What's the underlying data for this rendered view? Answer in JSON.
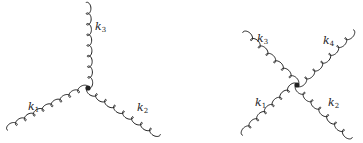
{
  "diagrams": [
    {
      "name": "three-gluon-vertex",
      "vertex": {
        "x": 88,
        "y": 88
      },
      "legs": [
        {
          "name": "k3",
          "end": {
            "x": 86,
            "y": 3
          },
          "label": {
            "base": "k",
            "sub": "3",
            "x": 95,
            "y": 30
          }
        },
        {
          "name": "k1",
          "end": {
            "x": 8,
            "y": 130
          },
          "label": {
            "base": "k",
            "sub": "1",
            "x": 28,
            "y": 110
          }
        },
        {
          "name": "k2",
          "end": {
            "x": 160,
            "y": 134
          },
          "label": {
            "base": "k",
            "sub": "2",
            "x": 137,
            "y": 111
          }
        }
      ]
    },
    {
      "name": "four-gluon-vertex",
      "vertex": {
        "x": 297,
        "y": 85
      },
      "legs": [
        {
          "name": "k3",
          "end": {
            "x": 243,
            "y": 33
          },
          "label": {
            "base": "k",
            "sub": "3",
            "x": 257,
            "y": 42
          }
        },
        {
          "name": "k4",
          "end": {
            "x": 353,
            "y": 30
          },
          "label": {
            "base": "k",
            "sub": "4",
            "x": 323,
            "y": 44
          }
        },
        {
          "name": "k1",
          "end": {
            "x": 243,
            "y": 135
          },
          "label": {
            "base": "k",
            "sub": "1",
            "x": 255,
            "y": 106
          }
        },
        {
          "name": "k2",
          "end": {
            "x": 352,
            "y": 137
          },
          "label": {
            "base": "k",
            "sub": "2",
            "x": 328,
            "y": 106
          }
        }
      ]
    }
  ],
  "colors": {
    "line": "#222222",
    "background": "#ffffff"
  }
}
